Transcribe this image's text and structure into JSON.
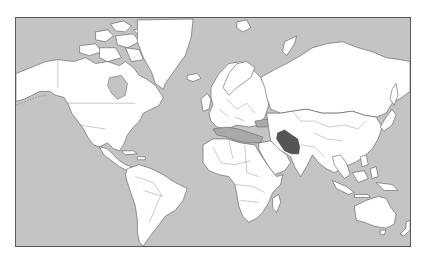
{
  "map": {
    "type": "world-locator-map",
    "projection": "Mercator",
    "title_visible": "",
    "highlighted_country": "Iran",
    "colors": {
      "ocean": "#c4c4c4",
      "land": "#ffffff",
      "inland_seas": "#a9a9a9",
      "highlight": "#555555",
      "coastline": "#4a4a4a",
      "frame_border": "#5a5a5a"
    },
    "regions": [
      {
        "id": "north-america",
        "label": "North America"
      },
      {
        "id": "greenland",
        "label": "Greenland"
      },
      {
        "id": "south-america",
        "label": "South America"
      },
      {
        "id": "europe",
        "label": "Europe"
      },
      {
        "id": "africa",
        "label": "Africa"
      },
      {
        "id": "asia",
        "label": "Asia"
      },
      {
        "id": "australia",
        "label": "Australia"
      },
      {
        "id": "iran",
        "label": "Iran"
      }
    ]
  }
}
